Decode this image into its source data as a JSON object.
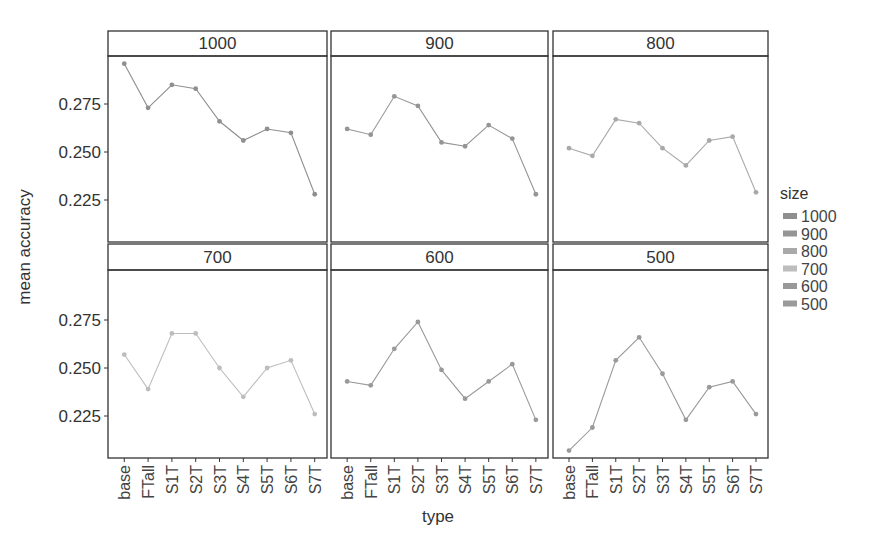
{
  "chart_data": {
    "type": "line",
    "layout": "facet_wrap",
    "facet_by": "size",
    "xlabel": "type",
    "ylabel": "mean accuracy",
    "y_ticks": [
      0.225,
      0.25,
      0.275
    ],
    "y_tick_labels": [
      "0.225",
      "0.250",
      "0.275"
    ],
    "ylim": [
      0.2,
      0.3
    ],
    "grid": false,
    "categories": [
      "base",
      "FTall",
      "S1T",
      "S2T",
      "S3T",
      "S4T",
      "S5T",
      "S6T",
      "S7T"
    ],
    "legend": {
      "title": "size",
      "position": "right",
      "entries": [
        "1000",
        "900",
        "800",
        "700",
        "600",
        "500"
      ],
      "colors": [
        "#8f8f8f",
        "#959595",
        "#a9a9a9",
        "#bdbdbd",
        "#999999",
        "#9a9a9a"
      ]
    },
    "series": [
      {
        "name": "1000",
        "values": [
          0.296,
          0.273,
          0.285,
          0.283,
          0.266,
          0.256,
          0.262,
          0.26,
          0.228
        ]
      },
      {
        "name": "900",
        "values": [
          0.262,
          0.259,
          0.279,
          0.274,
          0.255,
          0.253,
          0.264,
          0.257,
          0.228
        ]
      },
      {
        "name": "800",
        "values": [
          0.252,
          0.248,
          0.267,
          0.265,
          0.252,
          0.243,
          0.256,
          0.258,
          0.229
        ]
      },
      {
        "name": "700",
        "values": [
          0.257,
          0.239,
          0.268,
          0.268,
          0.25,
          0.235,
          0.25,
          0.254,
          0.226
        ]
      },
      {
        "name": "600",
        "values": [
          0.243,
          0.241,
          0.26,
          0.274,
          0.249,
          0.234,
          0.243,
          0.252,
          0.223
        ]
      },
      {
        "name": "500",
        "values": [
          0.207,
          0.219,
          0.254,
          0.266,
          0.247,
          0.223,
          0.24,
          0.243,
          0.226
        ]
      }
    ]
  }
}
